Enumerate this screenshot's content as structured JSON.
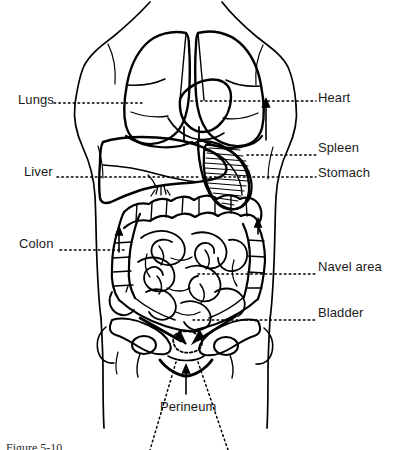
{
  "figure": {
    "type": "anatomical-line-diagram",
    "background_color": "#ffffff",
    "line_color": "#000000",
    "text_color": "#1a1a1a",
    "leader_line_style": "dotted",
    "width": 395,
    "height": 450
  },
  "labels": [
    {
      "id": "lungs",
      "text": "Lungs",
      "side": "left",
      "x": 18,
      "y": 93,
      "leader_from_x": 57,
      "leader_to_x": 142,
      "leader_y": 103
    },
    {
      "id": "heart",
      "text": "Heart",
      "side": "right",
      "x": 318,
      "y": 91,
      "leader_from_x": 193,
      "leader_to_x": 314,
      "leader_y": 101
    },
    {
      "id": "spleen",
      "text": "Spleen",
      "side": "right",
      "x": 318,
      "y": 141,
      "leader_from_x": 248,
      "leader_to_x": 314,
      "leader_y": 155
    },
    {
      "id": "liver",
      "text": "Liver",
      "side": "left",
      "x": 24,
      "y": 165,
      "leader_from_x": 58,
      "leader_to_x": 196,
      "leader_y": 177
    },
    {
      "id": "stomach",
      "text": "Stomach",
      "side": "right",
      "x": 318,
      "y": 166,
      "leader_from_x": 205,
      "leader_to_x": 314,
      "leader_y": 177
    },
    {
      "id": "colon",
      "text": "Colon",
      "side": "left",
      "x": 19,
      "y": 237,
      "leader_from_x": 62,
      "leader_to_x": 122,
      "leader_y": 250
    },
    {
      "id": "navel-area",
      "text": "Navel area",
      "side": "right",
      "x": 318,
      "y": 260,
      "leader_from_x": 200,
      "leader_to_x": 314,
      "leader_y": 274
    },
    {
      "id": "bladder",
      "text": "Bladder",
      "side": "right",
      "x": 318,
      "y": 306,
      "leader_from_x": 196,
      "leader_to_x": 314,
      "leader_y": 320
    },
    {
      "id": "perineum",
      "text": "Perineum",
      "side": "bottom",
      "x": 160,
      "y": 400,
      "leader_from_x": 0,
      "leader_to_x": 0,
      "leader_y": 0
    }
  ],
  "caption": {
    "text": "Figure 5-10",
    "visible": "partially-cut-off"
  },
  "organs": [
    {
      "id": "torso",
      "name": "torso-outline"
    },
    {
      "id": "lungs",
      "name": "lungs"
    },
    {
      "id": "heart",
      "name": "heart"
    },
    {
      "id": "liver",
      "name": "liver"
    },
    {
      "id": "stomach",
      "name": "stomach"
    },
    {
      "id": "spleen",
      "name": "spleen"
    },
    {
      "id": "colon",
      "name": "large-intestine-colon"
    },
    {
      "id": "small-intestine",
      "name": "small-intestine"
    },
    {
      "id": "pelvis",
      "name": "pelvic-bones"
    },
    {
      "id": "bladder",
      "name": "bladder"
    },
    {
      "id": "perineum",
      "name": "perineum"
    }
  ]
}
